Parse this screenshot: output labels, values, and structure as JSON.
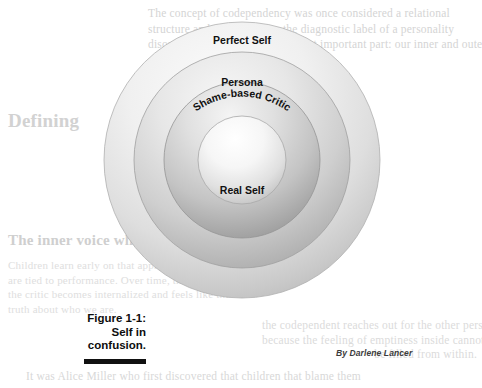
{
  "figure": {
    "caption_lines": [
      "Figure 1-1:",
      "Self in",
      "confusion."
    ],
    "byline": "By Darlene Lancer"
  },
  "diagram": {
    "type": "concentric-circles",
    "center": {
      "x": 242,
      "y": 160
    },
    "rings": [
      {
        "id": "perfect-self",
        "label": "Perfect Self",
        "radius": 138,
        "label_y": 40,
        "curved": false,
        "fill_light": "#f4f4f4",
        "fill_dark": "#c6c6c6"
      },
      {
        "id": "persona",
        "label": "Persona",
        "radius": 108,
        "label_y": 82,
        "curved": false,
        "fill_light": "#efefef",
        "fill_dark": "#b4b4b4"
      },
      {
        "id": "shame-based-critic",
        "label": "Shame-based Critic",
        "radius": 78,
        "label_y": 124,
        "curved": true,
        "fill_light": "#ececec",
        "fill_dark": "#a8a8a8"
      },
      {
        "id": "real-self",
        "label": "Real Self",
        "radius": 44,
        "label_y": 190,
        "curved": false,
        "fill_light": "#fbfbfb",
        "fill_dark": "#bdbdbd"
      }
    ]
  },
  "background_text": {
    "top_right": "The concept of codependency was once considered a relational\nstructure and was not given the diagnostic label of a personality\ndisorder. This brings us to the most important part: our inner and outer\nself, often confused with each other.",
    "heading_left": "Defining",
    "mid_left": "Shame is\nwhat has\nbeen called\na basic\nemotion.",
    "heading_bottom": "The inner voice whispers in her/you",
    "bottom_left": "Children learn early on that approval and love\nare tied to performance. Over time, the voice of\nthe critic becomes internalized and feels like the\ntruth about who we are.",
    "right_lower": "the codependent reaches out for the other person\nbecause the feeling of emptiness inside cannot\nbe filled from within.",
    "bottom_line": "It was Alice Miller who first discovered that children that blame them"
  },
  "colors": {
    "ink": "#111111",
    "ghost": "#d9d9d9",
    "rule": "#111111"
  }
}
